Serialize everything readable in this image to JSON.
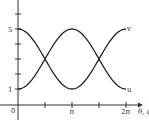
{
  "chart_data": {
    "type": "line",
    "title": "",
    "xlabel": "θ, φ",
    "ylabel": "",
    "x_ticks": [
      "0",
      "π",
      "2π"
    ],
    "y_ticks": [
      "1",
      "5"
    ],
    "xlim": [
      0,
      6.2832
    ],
    "ylim": [
      0,
      7
    ],
    "grid": false,
    "legend": "inline labels at right end of curves",
    "series": [
      {
        "name": "v",
        "formula": "3 - 2cos(θ)",
        "x": [
          0,
          1.5708,
          3.1416,
          4.7124,
          6.2832
        ],
        "values": [
          1,
          3,
          5,
          3,
          1
        ]
      },
      {
        "name": "u",
        "formula": "3 + 2cos(θ)",
        "x": [
          0,
          1.5708,
          3.1416,
          4.7124,
          6.2832
        ],
        "values": [
          5,
          3,
          1,
          3,
          5
        ]
      }
    ]
  },
  "labels": {
    "origin": "0",
    "y5": "5",
    "y1": "1",
    "xpi": "π",
    "x2pi": "2π",
    "xaxis": "θ, φ",
    "curve_top_right": "v",
    "curve_bottom_right": "u"
  }
}
